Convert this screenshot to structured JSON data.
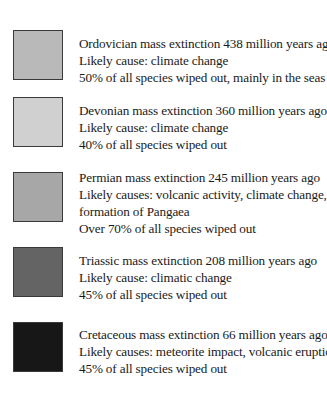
{
  "legend": {
    "entries": [
      {
        "title": "Ordovician mass extinction 438 million years ago",
        "lines": [
          "Likely cause: climate change",
          "50% of all species wiped out, mainly in the seas"
        ],
        "swatch_color": "#b9b9b9"
      },
      {
        "title": "Devonian mass extinction 360 million years ago",
        "lines": [
          "Likely cause: climate change",
          "40% of all species wiped out"
        ],
        "swatch_color": "#d0d0d0"
      },
      {
        "title": "Permian mass extinction 245 million years ago",
        "lines": [
          "Likely causes: volcanic activity, climate change,",
          "formation of Pangaea",
          "Over 70% of all species wiped out"
        ],
        "swatch_color": "#a7a7a7"
      },
      {
        "title": "Triassic mass extinction 208 million years ago",
        "lines": [
          "Likely cause: climatic change",
          "45% of all species wiped out"
        ],
        "swatch_color": "#646464"
      },
      {
        "title": "Cretaceous mass extinction 66 million years ago",
        "lines": [
          "Likely causes: meteorite impact, volcanic eruptions",
          "45% of all species wiped out"
        ],
        "swatch_color": "#171717"
      }
    ]
  }
}
